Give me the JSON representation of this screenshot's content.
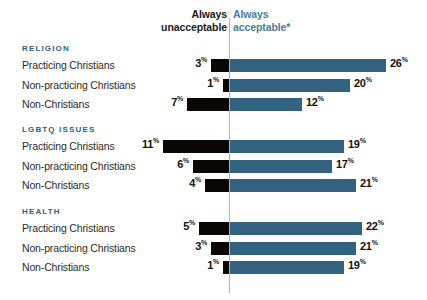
{
  "header": {
    "left_line1": "Always",
    "left_line2": "unacceptable",
    "right_line1": "Always",
    "right_line2": "acceptable*"
  },
  "colors": {
    "negative_bar": "#0b0704",
    "positive_bar": "#336281",
    "group_title": "#2f6183",
    "axis_line": "#b9b2a8",
    "header_left": "#1b1b1b",
    "header_right": "#4a7c9b",
    "row_label": "#2b2b2b",
    "background": "#ffffff"
  },
  "groups": [
    {
      "title": "RELIGION",
      "rows": [
        {
          "label": "Practicing Christians",
          "neg": 3,
          "neg_text": "3",
          "pos": 26,
          "pos_text": "26",
          "suffix": "%"
        },
        {
          "label": "Non-practicing Christians",
          "neg": 1,
          "neg_text": "1",
          "pos": 20,
          "pos_text": "20",
          "suffix": "%"
        },
        {
          "label": "Non-Christians",
          "neg": 7,
          "neg_text": "7",
          "pos": 12,
          "pos_text": "12",
          "suffix": "%"
        }
      ]
    },
    {
      "title": "LGBTQ ISSUES",
      "rows": [
        {
          "label": "Practicing Christians",
          "neg": 11,
          "neg_text": "11",
          "pos": 19,
          "pos_text": "19",
          "suffix": "%"
        },
        {
          "label": "Non-practicing Christians",
          "neg": 6,
          "neg_text": "6",
          "pos": 17,
          "pos_text": "17",
          "suffix": "%"
        },
        {
          "label": "Non-Christians",
          "neg": 4,
          "neg_text": "4",
          "pos": 21,
          "pos_text": "21",
          "suffix": "%"
        }
      ]
    },
    {
      "title": "HEALTH",
      "rows": [
        {
          "label": "Practicing Christians",
          "neg": 5,
          "neg_text": "5",
          "pos": 22,
          "pos_text": "22",
          "suffix": "%"
        },
        {
          "label": "Non-practicing Christians",
          "neg": 3,
          "neg_text": "3",
          "pos": 21,
          "pos_text": "21",
          "suffix": "%"
        },
        {
          "label": "Non-Christians",
          "neg": 1,
          "neg_text": "1",
          "pos": 19,
          "pos_text": "19",
          "suffix": "%"
        }
      ]
    }
  ],
  "chart_data": {
    "type": "bar",
    "title": "",
    "subtitle": "",
    "orientation": "horizontal",
    "layout": "diverging-bidirectional",
    "xlabel": "",
    "ylabel": "",
    "grid": false,
    "legend_position": "top",
    "axis_center_value": 0,
    "units": "%",
    "pixels_per_percent": 6,
    "legend": [
      {
        "name": "Always unacceptable",
        "color": "#0b0704",
        "direction": "left"
      },
      {
        "name": "Always acceptable*",
        "color": "#336281",
        "direction": "right"
      }
    ],
    "groups": [
      "RELIGION",
      "LGBTQ ISSUES",
      "HEALTH"
    ],
    "categories": [
      "RELIGION / Practicing Christians",
      "RELIGION / Non-practicing Christians",
      "RELIGION / Non-Christians",
      "LGBTQ ISSUES / Practicing Christians",
      "LGBTQ ISSUES / Non-practicing Christians",
      "LGBTQ ISSUES / Non-Christians",
      "HEALTH / Practicing Christians",
      "HEALTH / Non-practicing Christians",
      "HEALTH / Non-Christians"
    ],
    "series": [
      {
        "name": "Always unacceptable",
        "color": "#0b0704",
        "values": [
          3,
          1,
          7,
          11,
          6,
          4,
          5,
          3,
          1
        ]
      },
      {
        "name": "Always acceptable*",
        "color": "#336281",
        "values": [
          26,
          20,
          12,
          19,
          17,
          21,
          22,
          21,
          19
        ]
      }
    ],
    "annotations": [
      "* asterisk footnote marker on 'Always acceptable'"
    ]
  }
}
